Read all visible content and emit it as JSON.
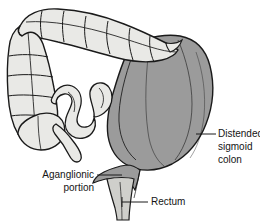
{
  "figure": {
    "background_color": "#ffffff"
  },
  "colors": {
    "normal_bowel_fill": "#e9e9e6",
    "distended_fill": "#9b9b9b",
    "distended_fill_dark": "#8d8d8d",
    "rectum_fill": "#cfcfcb",
    "outline": "#1a1a1a",
    "inner_line": "#6e6e6e",
    "label_text": "#141414"
  },
  "labels": [
    {
      "id": "distended-sigmoid-colon",
      "lines": [
        "Distended",
        "sigmoid",
        "colon"
      ],
      "line1": "Distended",
      "line2": "sigmoid",
      "line3": "colon"
    },
    {
      "id": "aganglionic-portion",
      "lines": [
        "Aganglionic",
        "portion"
      ],
      "line1": "Aganglionic",
      "line2": "portion"
    },
    {
      "id": "rectum",
      "lines": [
        "Rectum"
      ],
      "line1": "Rectum"
    }
  ],
  "structures": [
    {
      "id": "transverse-colon",
      "name": "Transverse colon",
      "shading": "light"
    },
    {
      "id": "ascending-colon",
      "name": "Ascending colon",
      "shading": "light"
    },
    {
      "id": "cecum",
      "name": "Cecum",
      "shading": "light"
    },
    {
      "id": "appendix",
      "name": "Appendix",
      "shading": "light"
    },
    {
      "id": "small-bowel-loop",
      "name": "Small bowel loop",
      "shading": "light"
    },
    {
      "id": "descending-colon",
      "name": "Descending colon",
      "shading": "light"
    },
    {
      "id": "distended-sigmoid",
      "name": "Distended sigmoid colon",
      "shading": "dark"
    },
    {
      "id": "aganglionic-segment",
      "name": "Aganglionic narrowed segment",
      "shading": "dark"
    },
    {
      "id": "rectum-tube",
      "name": "Rectum",
      "shading": "pale"
    }
  ]
}
